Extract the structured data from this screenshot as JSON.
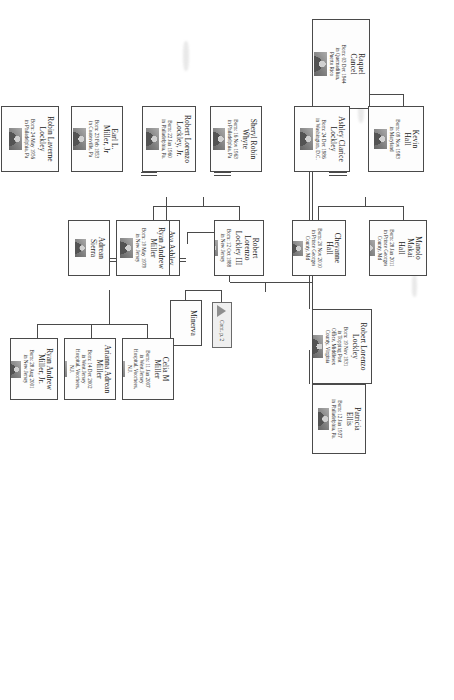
{
  "document": {
    "type": "family-tree-chart",
    "orientation": "rotated-90",
    "continuation": {
      "label": "Cont. p. 2",
      "icon": "triangle-up-icon"
    }
  },
  "people": {
    "raquel_cancel": {
      "name": "Raquel\nCancel",
      "details": "Born: 03 Dec 1944\nin Quemadilian,\nPuerto Rico"
    },
    "robert_lockley": {
      "name": "Robert Lorenzo\nLockley",
      "details": "Born: 19 Nov 1931\nin Topping Post\nOffice, Middlesex\nCounty, Virginia"
    },
    "patricia_ellis": {
      "name": "Patricia\nEllis",
      "details": "Born: 12 Jan 1937\nin Philadelphia, Pa."
    },
    "kevin_hall": {
      "name": "Kevin\nHall",
      "details": "Born: 09 Nov 1983\nin Maryland"
    },
    "ashley_lockley": {
      "name": "Ashley Clarice\nLockley",
      "details": "Born: 24 Dec 1986\nin Washington, D.C."
    },
    "manolo_hall": {
      "name": "Manolo Makai\nHall",
      "details": "Born: 28 Jan 2011\nin Prince Georges\nCounty, Md"
    },
    "cheyanne_hall": {
      "name": "Cheyanne\nHall",
      "details": "Born: 20 Nov 2010\nin Prince Georges\nCounty, Md"
    },
    "sheryl_whyte": {
      "name": "Sheryl Robin\nWhyte",
      "details": "Born: 16 Nov 1963\nin Philadelphia, Pa"
    },
    "robert_jr": {
      "name": "Robert Lorenzo\nLockley, Jr.",
      "details": "Born: 22 Jan 1960\nin Philadelphia, Pa."
    },
    "robert_iii": {
      "name": "Robert Lorenzo\nLockley III",
      "details": "Born: 12 Oct 1988\nin New Jersey"
    },
    "ava_lockley": {
      "name": "Ava Ashley\nLockley",
      "details": "Born: 17 Oct 1984\nin New Jersey"
    },
    "minerva": {
      "name": "Minerva",
      "details": ""
    },
    "earl_miller": {
      "name": "Earl L.\nMiller, Jr",
      "details": "Born: 23 Feb 1953\nin Coatesville, Pa"
    },
    "robin_lockley": {
      "name": "Robin Laverne\nLockley",
      "details": "Born: 24 May 1956\nin Philadelphia, Pa"
    },
    "ryan_miller": {
      "name": "Ryan Andrew\nMiller",
      "details": "Born: 19 May 1979\nin New Jersey"
    },
    "adrean_sierra": {
      "name": "Adrean\nSierra",
      "details": ""
    },
    "celia_miller": {
      "name": "Celia M\nMiller",
      "details": "Born: 11 Jan 2007\nin West Jersey\nHospital, Voorhees,\nN.J."
    },
    "arianna_miller": {
      "name": "Arianna Adrean\nMiller",
      "details": "Born: 14 Dec 2002\nin West Jersey\nHospital, Voorhees,\nN.J."
    },
    "ryan_miller_jr": {
      "name": "Ryan Andrew\nMiller, Jr.",
      "details": "Born: 28 Aug 2001\nin New Jersey"
    }
  },
  "colors": {
    "border": "#4a4a4a",
    "background": "#ffffff",
    "text": "#1a1a1a",
    "continuation_fill": "#efefef"
  }
}
